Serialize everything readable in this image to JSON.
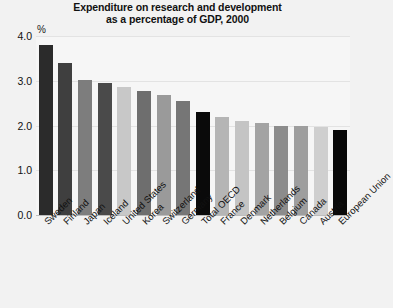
{
  "chart_data": {
    "type": "bar",
    "title": "Expenditure on research and development as a percentage of GDP, 2000",
    "title_lines": [
      "Expenditure on research and development",
      "as a percentage of GDP, 2000"
    ],
    "unit_label": "%",
    "xlabel": "",
    "ylabel": "",
    "ylim": [
      0.0,
      4.0
    ],
    "yticks": [
      "0.0",
      "1.0",
      "2.0",
      "3.0",
      "4.0"
    ],
    "ytick_values": [
      0.0,
      1.0,
      2.0,
      3.0,
      4.0
    ],
    "grid": true,
    "legend": "none",
    "categories": [
      "Sweden",
      "Finland",
      "Japan",
      "Iceland",
      "United States",
      "Korea",
      "Switzerland",
      "Germany",
      "Total OECD",
      "France",
      "Denmark",
      "Netherlands",
      "Belgium",
      "Canada",
      "Austria",
      "European Union"
    ],
    "values": [
      3.8,
      3.4,
      3.02,
      2.95,
      2.85,
      2.78,
      2.68,
      2.55,
      2.3,
      2.2,
      2.1,
      2.05,
      2.0,
      2.0,
      1.97,
      1.9
    ],
    "bar_colors": [
      "#2b2b2b",
      "#3f3f3f",
      "#7d7d7d",
      "#4a4a4a",
      "#c8c8c8",
      "#6e6e6e",
      "#9a9a9a",
      "#767676",
      "#0a0a0a",
      "#b5b5b5",
      "#c4c4c4",
      "#a3a3a3",
      "#8c8c8c",
      "#9e9e9e",
      "#cfcfcf",
      "#0a0a0a"
    ]
  },
  "style": {
    "page_background": "#f2f2f2",
    "plot_background": "#f6f6f6",
    "gridline_color": "#e3e3e3",
    "axis_color": "#bdbdbd",
    "text_color": "#111111"
  }
}
